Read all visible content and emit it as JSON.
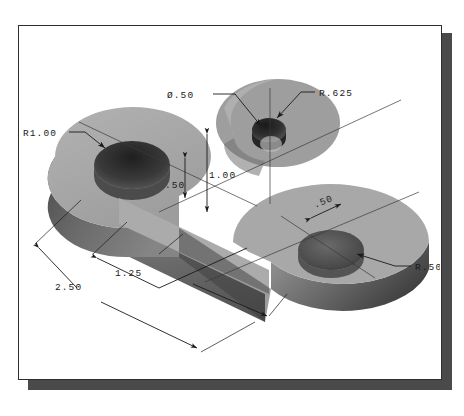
{
  "drawing": {
    "title": "Isometric pictorial of a C-shaped link with boss",
    "sheet_border_color": "#2e2e2e",
    "shadow_color": "#4a4a4a",
    "background_color": "#ffffff",
    "shading": {
      "top_face": "#a6a6a6",
      "top_face_light": "#b4b4b4",
      "side_face_dark": "#5a5a5a",
      "side_face_mid": "#757575",
      "bore_dark": "#2a2a2a",
      "bore_mid": "#555555",
      "boss_top": "#9a9a9a",
      "boss_side": "#6d6d6d",
      "highlight": "#c9c9c9"
    },
    "annotations": [
      {
        "id": "r1-00",
        "label": "R1.00",
        "type": "radius-leader",
        "x": 22,
        "y": 124
      },
      {
        "id": "dia-50",
        "label": "Ø.50",
        "type": "diameter-leader",
        "x": 184,
        "y": 88
      },
      {
        "id": "r-625",
        "label": "R.625",
        "type": "radius-leader",
        "x": 302,
        "y": 86
      },
      {
        "id": "r-50",
        "label": "R.50",
        "type": "radius-leader",
        "x": 401,
        "y": 262
      },
      {
        "id": "h-1-00",
        "label": "1.00",
        "type": "vertical-dim",
        "x": 206,
        "y": 152
      },
      {
        "id": "h-50",
        "label": ".50",
        "type": "vertical-dim",
        "x": 185,
        "y": 166
      },
      {
        "id": "w-50",
        "label": ".50",
        "type": "linear-dim",
        "x": 322,
        "y": 209
      },
      {
        "id": "d-1-25",
        "label": "1.25",
        "type": "linear-dim",
        "x": 116,
        "y": 260
      },
      {
        "id": "d-2-50",
        "label": "2.50",
        "type": "linear-dim",
        "x": 56,
        "y": 270
      }
    ]
  }
}
